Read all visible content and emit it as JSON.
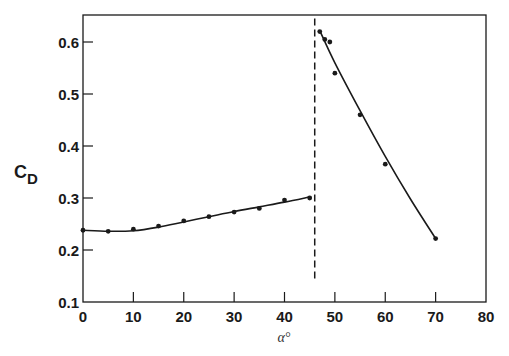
{
  "chart_data": {
    "type": "scatter",
    "title": "",
    "xlabel": "α°",
    "ylabel": "C_D",
    "ylabel_main": "C",
    "ylabel_sub": "D",
    "xlim": [
      0,
      80
    ],
    "ylim": [
      0.1,
      0.65
    ],
    "x_ticks": [
      0,
      10,
      20,
      30,
      40,
      50,
      60,
      70,
      80
    ],
    "x_tick_labels": [
      "0",
      "10",
      "20",
      "30",
      "40",
      "50",
      "60",
      "70",
      "80"
    ],
    "y_ticks": [
      0.1,
      0.2,
      0.3,
      0.4,
      0.5,
      0.6
    ],
    "y_tick_labels": [
      "0.1",
      "0.2",
      "0.3",
      "0.4",
      "0.5",
      "0.6"
    ],
    "grid": false,
    "legend": null,
    "series": [
      {
        "name": "low-angle regime",
        "x": [
          0,
          5,
          10,
          15,
          20,
          25,
          30,
          35,
          40,
          45
        ],
        "values": [
          0.238,
          0.236,
          0.24,
          0.246,
          0.256,
          0.264,
          0.273,
          0.28,
          0.296,
          0.3
        ],
        "fit_curve": [
          [
            0,
            0.238
          ],
          [
            5,
            0.236
          ],
          [
            10,
            0.237
          ],
          [
            15,
            0.244
          ],
          [
            20,
            0.254
          ],
          [
            25,
            0.264
          ],
          [
            30,
            0.274
          ],
          [
            35,
            0.283
          ],
          [
            40,
            0.292
          ],
          [
            45,
            0.302
          ]
        ]
      },
      {
        "name": "high-angle regime",
        "x": [
          47,
          48,
          49,
          50,
          55,
          60,
          70
        ],
        "values": [
          0.62,
          0.605,
          0.6,
          0.54,
          0.46,
          0.365,
          0.222
        ],
        "fit_curve": [
          [
            47,
            0.622
          ],
          [
            50,
            0.56
          ],
          [
            55,
            0.468
          ],
          [
            60,
            0.38
          ],
          [
            65,
            0.298
          ],
          [
            70,
            0.222
          ]
        ]
      }
    ],
    "annotations": [
      {
        "type": "vertical-dashed-line",
        "x": 46,
        "y_range": [
          0.13,
          0.63
        ]
      }
    ]
  },
  "colors": {
    "ink": "#1a1a1a",
    "background": "#ffffff"
  }
}
